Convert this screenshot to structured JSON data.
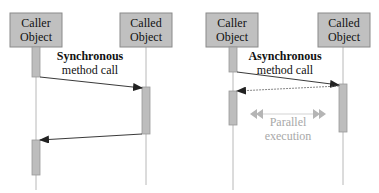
{
  "colors": {
    "box_fill": "#c0c0c0",
    "box_stroke": "#8a8a8a",
    "activation_fill": "#bdbdbd",
    "lifeline": "#b8b8b8",
    "arrow": "#222222",
    "parallel": "#b5b5b5",
    "text": "#111111",
    "parallel_text": "#a8a8a8"
  },
  "sync": {
    "caller_label": [
      "Caller",
      "Object"
    ],
    "called_label": [
      "Called",
      "Object"
    ],
    "caption_bold": "Synchronous",
    "caption": "method call"
  },
  "async": {
    "caller_label": [
      "Caller",
      "Object"
    ],
    "called_label": [
      "Called",
      "Object"
    ],
    "caption_bold": "Asynchronous",
    "caption": "method call",
    "parallel_label": [
      "Parallel",
      "execution"
    ]
  }
}
